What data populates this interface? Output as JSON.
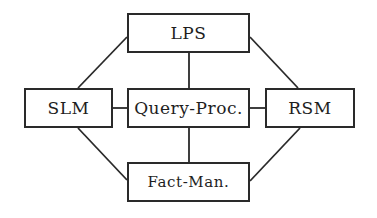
{
  "diagram": {
    "type": "module-architecture",
    "colors": {
      "line": "#2a2a2a",
      "text": "#1e1e1e",
      "background": "#ffffff"
    },
    "nodes": [
      {
        "id": "lps",
        "label": "LPS",
        "x": 127,
        "y": 13,
        "w": 123,
        "h": 40
      },
      {
        "id": "slm",
        "label": "SLM",
        "x": 24,
        "y": 88,
        "w": 89,
        "h": 40
      },
      {
        "id": "query",
        "label": "Query-Proc.",
        "x": 127,
        "y": 88,
        "w": 123,
        "h": 40
      },
      {
        "id": "rsm",
        "label": "RSM",
        "x": 265,
        "y": 88,
        "w": 90,
        "h": 40
      },
      {
        "id": "fact",
        "label": "Fact-Man.",
        "x": 127,
        "y": 162,
        "w": 123,
        "h": 40
      }
    ],
    "edges": [
      {
        "from": "lps",
        "to": "query",
        "x1": 189,
        "y1": 53,
        "x2": 189,
        "y2": 88
      },
      {
        "from": "lps",
        "to": "slm",
        "x1": 127,
        "y1": 37,
        "x2": 78,
        "y2": 88
      },
      {
        "from": "lps",
        "to": "rsm",
        "x1": 250,
        "y1": 37,
        "x2": 298,
        "y2": 88
      },
      {
        "from": "slm",
        "to": "query",
        "x1": 113,
        "y1": 108,
        "x2": 127,
        "y2": 108
      },
      {
        "from": "query",
        "to": "rsm",
        "x1": 250,
        "y1": 108,
        "x2": 265,
        "y2": 108
      },
      {
        "from": "query",
        "to": "fact",
        "x1": 189,
        "y1": 128,
        "x2": 189,
        "y2": 162
      },
      {
        "from": "slm",
        "to": "fact",
        "x1": 78,
        "y1": 128,
        "x2": 127,
        "y2": 180
      },
      {
        "from": "rsm",
        "to": "fact",
        "x1": 300,
        "y1": 128,
        "x2": 250,
        "y2": 181
      }
    ]
  }
}
